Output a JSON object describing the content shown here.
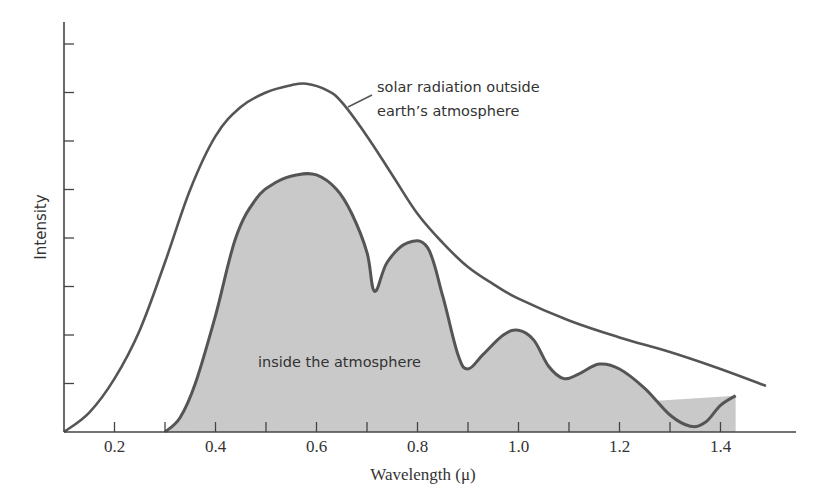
{
  "chart_data": {
    "type": "line",
    "title": "",
    "xlabel": "Wavelength (μ)",
    "ylabel": "Intensity",
    "xlim": [
      0.1,
      1.55
    ],
    "ylim": [
      0,
      8.5
    ],
    "grid": false,
    "x_ticks": [
      0.2,
      0.3,
      0.4,
      0.5,
      0.6,
      0.7,
      0.8,
      0.9,
      1.0,
      1.1,
      1.2,
      1.3,
      1.4
    ],
    "x_tick_labels": [
      "0.2",
      "0.4",
      "0.6",
      "0.8",
      "1.0",
      "1.2",
      "1.4"
    ],
    "x_tick_label_values": [
      0.2,
      0.4,
      0.6,
      0.8,
      1.0,
      1.2,
      1.4
    ],
    "y_ticks": [
      1,
      2,
      3,
      4,
      5,
      6,
      7,
      8
    ],
    "y_tick_labels": [],
    "series": [
      {
        "name": "solar radiation outside earth's atmosphere",
        "style": "line",
        "x": [
          0.1,
          0.15,
          0.2,
          0.25,
          0.3,
          0.35,
          0.4,
          0.45,
          0.5,
          0.55,
          0.58,
          0.62,
          0.65,
          0.7,
          0.75,
          0.8,
          0.85,
          0.9,
          0.95,
          1.0,
          1.1,
          1.2,
          1.3,
          1.4,
          1.49
        ],
        "y": [
          0.0,
          0.4,
          1.1,
          2.1,
          3.5,
          5.0,
          6.1,
          6.7,
          7.0,
          7.15,
          7.18,
          7.05,
          6.8,
          6.1,
          5.3,
          4.5,
          3.9,
          3.4,
          3.05,
          2.75,
          2.3,
          1.95,
          1.65,
          1.3,
          0.95
        ]
      },
      {
        "name": "inside the atmosphere",
        "style": "filled",
        "x": [
          0.3,
          0.33,
          0.36,
          0.4,
          0.44,
          0.48,
          0.52,
          0.56,
          0.6,
          0.64,
          0.67,
          0.7,
          0.715,
          0.74,
          0.78,
          0.82,
          0.85,
          0.88,
          0.9,
          0.93,
          0.97,
          1.0,
          1.03,
          1.06,
          1.09,
          1.12,
          1.16,
          1.2,
          1.25,
          1.3,
          1.34,
          1.37,
          1.4,
          1.43
        ],
        "y": [
          0.0,
          0.3,
          1.0,
          2.4,
          4.0,
          4.8,
          5.15,
          5.3,
          5.3,
          5.0,
          4.5,
          3.7,
          2.9,
          3.5,
          3.9,
          3.8,
          2.8,
          1.6,
          1.3,
          1.6,
          2.0,
          2.1,
          1.9,
          1.35,
          1.1,
          1.2,
          1.4,
          1.3,
          0.9,
          0.35,
          0.12,
          0.2,
          0.55,
          0.75
        ]
      }
    ],
    "annotations": [
      {
        "text": "solar radiation outside",
        "line": 1
      },
      {
        "text": "earth’s atmosphere",
        "line": 2
      },
      {
        "text": "inside the atmosphere",
        "target": "inside-series"
      }
    ]
  },
  "labels": {
    "outside_line1": "solar radiation outside",
    "outside_line2": "earth’s atmosphere",
    "inside": "inside the atmosphere",
    "xlabel": "Wavelength (μ)",
    "ylabel": "Intensity"
  },
  "colors": {
    "fill": "#c9c9c9",
    "stroke": "#555555",
    "axis": "#444444",
    "background": "#ffffff"
  }
}
